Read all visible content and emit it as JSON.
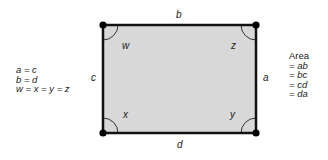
{
  "diagram": {
    "shape": "rectangle",
    "fill_color": "#d8d8d8",
    "stroke_color": "#111111",
    "sides": {
      "top": "b",
      "right": "a",
      "bottom": "d",
      "left": "c"
    },
    "angles": {
      "top_left": "w",
      "top_right": "z",
      "bottom_left": "x",
      "bottom_right": "y"
    }
  },
  "relations": {
    "lines": [
      "a = c",
      "b = d",
      "w = x = y = z"
    ]
  },
  "area": {
    "title": "Area",
    "lines": [
      "= ab",
      "= bc",
      "= cd",
      "= da"
    ]
  }
}
